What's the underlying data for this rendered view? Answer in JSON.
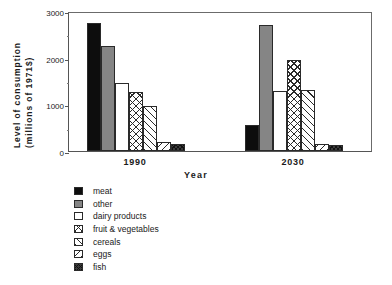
{
  "chart_data": {
    "type": "bar",
    "title": "",
    "xlabel": "Year",
    "ylabel_line1": "Level  of  consumption",
    "ylabel_line2": "(millions  of  1971$)",
    "categories": [
      "1990",
      "2030"
    ],
    "ylim": [
      0,
      3000
    ],
    "ytick_major": [
      0,
      1000,
      2000,
      3000
    ],
    "ytick_major_labels": [
      "0",
      "1000",
      "2000",
      "3000"
    ],
    "ytick_minor": [
      500,
      1500,
      2500
    ],
    "grid": false,
    "legend_position": "below-left",
    "series": [
      {
        "name": "meat",
        "pattern": "solid-black",
        "color": "#0d0d0d",
        "values": [
          2750,
          560
        ]
      },
      {
        "name": "other",
        "pattern": "solid-gray",
        "color": "#858585",
        "values": [
          2250,
          2700
        ]
      },
      {
        "name": "dairy products",
        "pattern": "white",
        "color": "#ffffff",
        "values": [
          1450,
          1290
        ]
      },
      {
        "name": "fruit & vegetables",
        "pattern": "cross-hatch",
        "color": "#ffffff",
        "values": [
          1270,
          1950
        ]
      },
      {
        "name": "cereals",
        "pattern": "diagonal-fwd",
        "color": "#ffffff",
        "values": [
          960,
          1300
        ]
      },
      {
        "name": "eggs",
        "pattern": "diagonal-back",
        "color": "#ffffff",
        "values": [
          190,
          150
        ]
      },
      {
        "name": "fish",
        "pattern": "dense-hatch",
        "color": "#3a3a3a",
        "values": [
          160,
          120
        ]
      }
    ]
  },
  "legend": {
    "items": [
      {
        "label": "meat"
      },
      {
        "label": "other"
      },
      {
        "label": "dairy products"
      },
      {
        "label": "fruit & vegetables"
      },
      {
        "label": "cereals"
      },
      {
        "label": "eggs"
      },
      {
        "label": "fish"
      }
    ]
  }
}
